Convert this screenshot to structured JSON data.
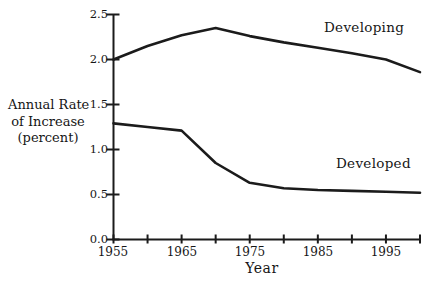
{
  "figure": {
    "background": "#ffffff",
    "ink_color": "#1b1b1b"
  },
  "chart_data": {
    "type": "line",
    "title": "",
    "xlabel": "Year",
    "ylabel": "Annual Rate of Increase (percent)",
    "ylabel_lines": [
      "Annual Rate",
      "of Increase",
      "(percent)"
    ],
    "x": [
      1955,
      1960,
      1965,
      1970,
      1975,
      1980,
      1985,
      1990,
      1995,
      2000
    ],
    "series": [
      {
        "name": "Developing",
        "values": [
          2.0,
          2.15,
          2.27,
          2.35,
          2.26,
          2.19,
          2.13,
          2.07,
          2.0,
          1.86
        ]
      },
      {
        "name": "Developed",
        "values": [
          1.29,
          1.25,
          1.21,
          0.85,
          0.63,
          0.57,
          0.55,
          0.54,
          0.53,
          0.52
        ]
      }
    ],
    "xlim": [
      1955,
      2000
    ],
    "ylim": [
      0,
      2.5
    ],
    "x_ticks": [
      1955,
      1960,
      1965,
      1970,
      1975,
      1980,
      1985,
      1990,
      1995,
      2000
    ],
    "x_tick_labels": [
      "1955",
      "1965",
      "1975",
      "1985",
      "1995"
    ],
    "y_ticks": [
      0,
      0.5,
      1,
      1.5,
      2,
      2.5
    ],
    "y_tick_labels_top_to_bottom": [
      "2.5",
      "2.0",
      "1.5",
      "1.0",
      "0.5",
      "0.0"
    ],
    "grid": false,
    "legend_position": "inline-annotations"
  }
}
